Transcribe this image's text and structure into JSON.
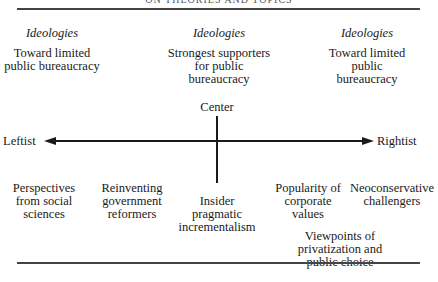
{
  "header": {
    "running_title": "ON THEORIES AND TOPICS"
  },
  "columns": [
    {
      "heading": "Ideologies",
      "description": [
        "Toward limited",
        "public bureaucracy"
      ]
    },
    {
      "heading": "Ideologies",
      "description": [
        "Strongest supporters",
        "for public",
        "bureaucracy"
      ]
    },
    {
      "heading": "Ideologies",
      "description": [
        "Toward limited",
        "public",
        "bureaucracy"
      ]
    }
  ],
  "axis": {
    "center_label": "Center",
    "left_label": "Leftist",
    "right_label": "Rightist"
  },
  "perspectives": [
    {
      "lines": [
        "Perspectives",
        "from social",
        "sciences"
      ]
    },
    {
      "lines": [
        "Reinventing",
        "government",
        "reformers"
      ]
    },
    {
      "lines": [
        "Insider",
        "pragmatic",
        "incrementalism"
      ]
    },
    {
      "lines": [
        "Popularity of",
        "corporate",
        "values"
      ]
    },
    {
      "lines": [
        "Neoconservative",
        "challengers"
      ]
    },
    {
      "lines": [
        "Viewpoints of",
        "privatization and",
        "public choice"
      ]
    }
  ]
}
